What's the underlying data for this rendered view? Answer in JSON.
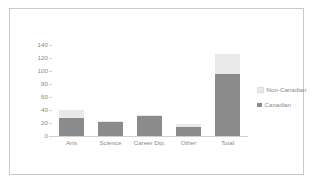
{
  "chart_data": {
    "type": "bar",
    "subtype": "stacked-bar",
    "title": "",
    "xlabel": "",
    "ylabel": "",
    "categories": [
      "Arts",
      "Science",
      "Career Dip.",
      "Other",
      "Total"
    ],
    "series": [
      {
        "name": "Canadian",
        "color": "#8b8b8b",
        "values": [
          28,
          22,
          31,
          14,
          95
        ]
      },
      {
        "name": "Non-Canadian",
        "color": "#e9e9e9",
        "values": [
          12,
          1,
          2,
          4,
          31
        ]
      }
    ],
    "totals": [
      40,
      23,
      33,
      18,
      126
    ],
    "ylim": [
      0,
      140
    ],
    "ytick_step": 20,
    "yticks": [
      140,
      120,
      100,
      80,
      60,
      40,
      20,
      0
    ],
    "ytick_labels": [
      "140",
      "120",
      "100",
      "80",
      "60",
      "40",
      "20",
      "0"
    ],
    "grid": false,
    "legend_position": "right",
    "legend_order": [
      "Non-Canadian",
      "Canadian"
    ],
    "stack_order_bottom_to_top": [
      "Canadian",
      "Non-Canadian"
    ],
    "border_color": "#c9c9c9",
    "axis_color": "#d0d0d0",
    "text_color": "#8a8a8a",
    "background": "#ffffff"
  }
}
